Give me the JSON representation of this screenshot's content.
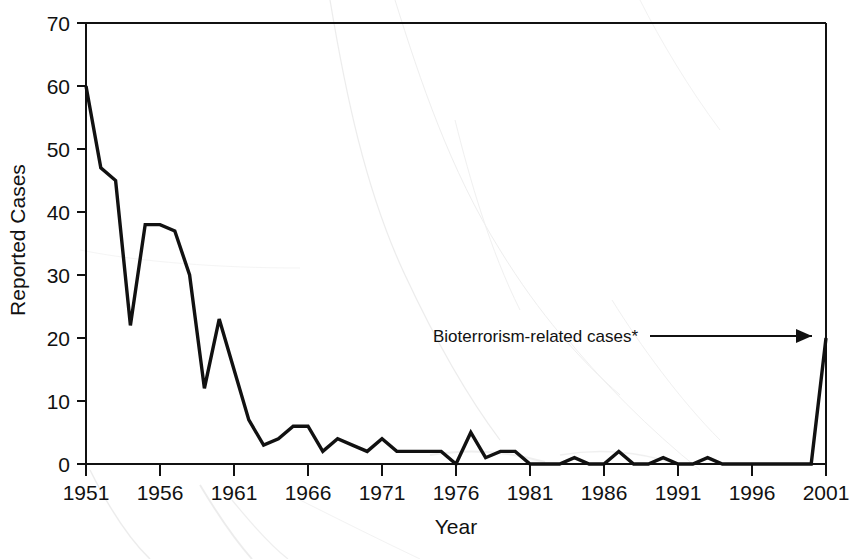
{
  "chart_data": {
    "type": "line",
    "title": "",
    "xlabel": "Year",
    "ylabel": "Reported Cases",
    "xlim": [
      1951,
      2001
    ],
    "ylim": [
      0,
      70
    ],
    "grid": false,
    "legend": "none",
    "x_ticks": [
      "1951",
      "1956",
      "1961",
      "1966",
      "1971",
      "1976",
      "1981",
      "1986",
      "1991",
      "1996",
      "2001"
    ],
    "y_ticks": [
      "0",
      "10",
      "20",
      "30",
      "40",
      "50",
      "60",
      "70"
    ],
    "line_color": "#111111",
    "series": [
      {
        "name": "Reported Cases",
        "x": [
          1951,
          1952,
          1953,
          1954,
          1955,
          1956,
          1957,
          1958,
          1959,
          1960,
          1961,
          1962,
          1963,
          1964,
          1965,
          1966,
          1967,
          1968,
          1969,
          1970,
          1971,
          1972,
          1973,
          1974,
          1975,
          1976,
          1977,
          1978,
          1979,
          1980,
          1981,
          1982,
          1983,
          1984,
          1985,
          1986,
          1987,
          1988,
          1989,
          1990,
          1991,
          1992,
          1993,
          1994,
          1995,
          1996,
          1997,
          1998,
          1999,
          2000,
          2001
        ],
        "values": [
          60,
          47,
          45,
          22,
          38,
          38,
          37,
          30,
          12,
          23,
          15,
          7,
          3,
          4,
          6,
          6,
          2,
          4,
          3,
          2,
          4,
          2,
          2,
          2,
          2,
          0,
          5,
          1,
          2,
          2,
          0,
          0,
          0,
          1,
          0,
          0,
          2,
          0,
          0,
          1,
          0,
          0,
          1,
          0,
          0,
          0,
          0,
          0,
          0,
          0,
          20
        ]
      }
    ],
    "annotations": [
      {
        "name": "bioterrorism-annotation",
        "text": "Bioterrorism-related cases*",
        "points_to_year": 2001,
        "points_to_value": 20
      }
    ]
  },
  "annotation": {
    "label": "Bioterrorism-related cases*"
  },
  "axes": {
    "y_title": "Reported Cases",
    "x_title": "Year"
  }
}
